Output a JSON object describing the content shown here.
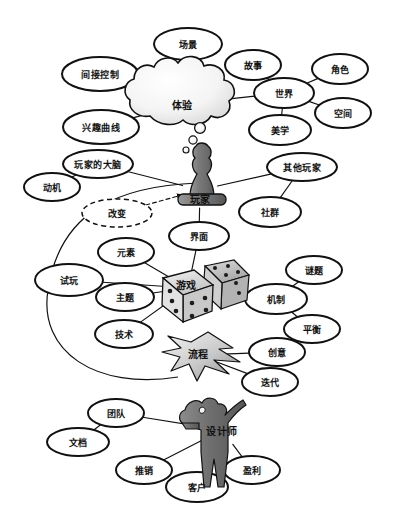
{
  "diagram": {
    "type": "mind-map",
    "background": "#ffffff",
    "stroke": "#111111"
  },
  "hubs": [
    {
      "id": "experience",
      "label": "体验",
      "shape": "cloud",
      "x": 182,
      "y": 104
    },
    {
      "id": "player",
      "label": "玩家",
      "shape": "pawn",
      "x": 200,
      "y": 190
    },
    {
      "id": "game",
      "label": "游戏",
      "shape": "dice",
      "x": 188,
      "y": 288
    },
    {
      "id": "process",
      "label": "流程",
      "shape": "arrow",
      "x": 198,
      "y": 355
    },
    {
      "id": "designer",
      "label": "设计师",
      "shape": "person",
      "x": 222,
      "y": 430
    }
  ],
  "nodes": [
    {
      "id": "scene",
      "label": "场景",
      "x": 188,
      "y": 44,
      "rx": 34,
      "ry": 16,
      "style": "solid"
    },
    {
      "id": "story",
      "label": "故事",
      "x": 253,
      "y": 65,
      "rx": 28,
      "ry": 15,
      "style": "solid"
    },
    {
      "id": "character",
      "label": "角色",
      "x": 340,
      "y": 69,
      "rx": 28,
      "ry": 15,
      "style": "solid"
    },
    {
      "id": "world",
      "label": "世界",
      "x": 284,
      "y": 93,
      "rx": 30,
      "ry": 15,
      "style": "solid"
    },
    {
      "id": "space",
      "label": "空间",
      "x": 343,
      "y": 113,
      "rx": 28,
      "ry": 15,
      "style": "solid"
    },
    {
      "id": "aesthetics",
      "label": "美学",
      "x": 280,
      "y": 130,
      "rx": 31,
      "ry": 15,
      "style": "solid"
    },
    {
      "id": "indirect-control",
      "label": "间接控制",
      "x": 100,
      "y": 74,
      "rx": 38,
      "ry": 17,
      "style": "solid"
    },
    {
      "id": "interest-curve",
      "label": "兴趣曲线",
      "x": 101,
      "y": 127,
      "rx": 38,
      "ry": 17,
      "style": "solid"
    },
    {
      "id": "player-brain",
      "label": "玩家的大脑",
      "x": 98,
      "y": 164,
      "rx": 35,
      "ry": 14,
      "style": "solid"
    },
    {
      "id": "motivation",
      "label": "动机",
      "x": 52,
      "y": 187,
      "rx": 28,
      "ry": 14,
      "style": "solid"
    },
    {
      "id": "other-players",
      "label": "其他玩家",
      "x": 302,
      "y": 167,
      "rx": 35,
      "ry": 14,
      "style": "solid"
    },
    {
      "id": "community",
      "label": "社群",
      "x": 270,
      "y": 212,
      "rx": 31,
      "ry": 15,
      "style": "solid"
    },
    {
      "id": "change",
      "label": "改变",
      "x": 117,
      "y": 213,
      "rx": 35,
      "ry": 14,
      "style": "dashed"
    },
    {
      "id": "interface",
      "label": "界面",
      "x": 199,
      "y": 236,
      "rx": 30,
      "ry": 14,
      "style": "solid"
    },
    {
      "id": "elements",
      "label": "元素",
      "x": 126,
      "y": 252,
      "rx": 28,
      "ry": 14,
      "style": "solid"
    },
    {
      "id": "playtesting",
      "label": "试玩",
      "x": 69,
      "y": 280,
      "rx": 34,
      "ry": 16,
      "style": "solid"
    },
    {
      "id": "theme",
      "label": "主题",
      "x": 125,
      "y": 297,
      "rx": 29,
      "ry": 14,
      "style": "solid"
    },
    {
      "id": "technology",
      "label": "技术",
      "x": 124,
      "y": 334,
      "rx": 29,
      "ry": 14,
      "style": "solid"
    },
    {
      "id": "puzzle",
      "label": "谜题",
      "x": 314,
      "y": 270,
      "rx": 28,
      "ry": 14,
      "style": "solid"
    },
    {
      "id": "mechanics",
      "label": "机制",
      "x": 276,
      "y": 299,
      "rx": 31,
      "ry": 15,
      "style": "solid"
    },
    {
      "id": "balance",
      "label": "平衡",
      "x": 312,
      "y": 329,
      "rx": 28,
      "ry": 14,
      "style": "solid"
    },
    {
      "id": "creativity",
      "label": "创意",
      "x": 277,
      "y": 352,
      "rx": 28,
      "ry": 14,
      "style": "solid"
    },
    {
      "id": "iteration",
      "label": "迭代",
      "x": 270,
      "y": 382,
      "rx": 28,
      "ry": 14,
      "style": "solid"
    },
    {
      "id": "team",
      "label": "团队",
      "x": 116,
      "y": 413,
      "rx": 28,
      "ry": 14,
      "style": "solid"
    },
    {
      "id": "documentation",
      "label": "文档",
      "x": 78,
      "y": 442,
      "rx": 31,
      "ry": 14,
      "style": "solid"
    },
    {
      "id": "marketing",
      "label": "推销",
      "x": 144,
      "y": 470,
      "rx": 28,
      "ry": 14,
      "style": "solid"
    },
    {
      "id": "client",
      "label": "客户",
      "x": 197,
      "y": 487,
      "rx": 31,
      "ry": 15,
      "style": "solid"
    },
    {
      "id": "profit",
      "label": "盈利",
      "x": 252,
      "y": 470,
      "rx": 28,
      "ry": 14,
      "style": "solid"
    }
  ],
  "edges": [
    {
      "from": "experience",
      "to": "scene",
      "style": "solid"
    },
    {
      "from": "experience",
      "to": "indirect-control",
      "style": "solid"
    },
    {
      "from": "experience",
      "to": "interest-curve",
      "style": "solid"
    },
    {
      "from": "experience",
      "to": "world",
      "style": "solid"
    },
    {
      "from": "world",
      "to": "story",
      "style": "solid"
    },
    {
      "from": "world",
      "to": "character",
      "style": "solid"
    },
    {
      "from": "world",
      "to": "space",
      "style": "solid"
    },
    {
      "from": "world",
      "to": "aesthetics",
      "style": "solid"
    },
    {
      "from": "player",
      "to": "player-brain",
      "style": "solid"
    },
    {
      "from": "player-brain",
      "to": "motivation",
      "style": "solid"
    },
    {
      "from": "player",
      "to": "other-players",
      "style": "solid"
    },
    {
      "from": "other-players",
      "to": "community",
      "style": "solid"
    },
    {
      "from": "player",
      "to": "interface",
      "style": "solid"
    },
    {
      "from": "interface",
      "to": "game",
      "style": "solid"
    },
    {
      "from": "change",
      "to": "player",
      "style": "dashed-arrow"
    },
    {
      "from": "game",
      "to": "elements",
      "style": "solid"
    },
    {
      "from": "game",
      "to": "playtesting",
      "style": "solid"
    },
    {
      "from": "game",
      "to": "theme",
      "style": "solid"
    },
    {
      "from": "game",
      "to": "technology",
      "style": "solid"
    },
    {
      "from": "game",
      "to": "mechanics",
      "style": "solid"
    },
    {
      "from": "mechanics",
      "to": "puzzle",
      "style": "solid"
    },
    {
      "from": "mechanics",
      "to": "balance",
      "style": "solid"
    },
    {
      "from": "process",
      "to": "creativity",
      "style": "solid"
    },
    {
      "from": "process",
      "to": "iteration",
      "style": "solid"
    },
    {
      "from": "designer",
      "to": "team",
      "style": "solid"
    },
    {
      "from": "team",
      "to": "documentation",
      "style": "solid"
    },
    {
      "from": "designer",
      "to": "marketing",
      "style": "solid"
    },
    {
      "from": "designer",
      "to": "client",
      "style": "solid"
    },
    {
      "from": "designer",
      "to": "profit",
      "style": "solid"
    }
  ],
  "arc": {
    "id": "feedback-loop",
    "description": "玩家到流程的大弧线"
  }
}
